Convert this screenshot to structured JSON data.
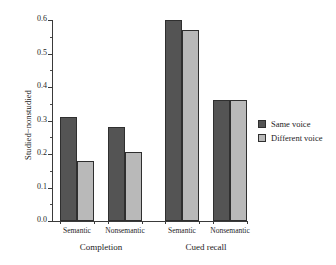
{
  "chart_data": {
    "type": "bar",
    "title": "",
    "subtitle": "",
    "xlabel": "",
    "ylabel": "Studied−nonstudied",
    "ylim": [
      0.0,
      0.6
    ],
    "grid": false,
    "legend_position": "right",
    "categories": [
      "Semantic",
      "Nonsemantic",
      "Semantic",
      "Nonsemantic"
    ],
    "group_labels": [
      "Completion",
      "Cued recall"
    ],
    "group_spans": [
      2,
      2
    ],
    "series": [
      {
        "name": "Same voice",
        "color": "#545454",
        "values": [
          0.31,
          0.28,
          0.6,
          0.36
        ]
      },
      {
        "name": "Different voice",
        "color": "#b9b9b9",
        "values": [
          0.18,
          0.205,
          0.57,
          0.36
        ]
      }
    ],
    "y_major_ticks": [
      {
        "value": 0.0,
        "label": "0.0"
      },
      {
        "value": 0.1,
        "label": "0.1"
      },
      {
        "value": 0.2,
        "label": "0.2"
      },
      {
        "value": 0.3,
        "label": "0.3"
      },
      {
        "value": 0.4,
        "label": "0.4"
      },
      {
        "value": 0.5,
        "label": "0.5"
      },
      {
        "value": 0.6,
        "label": "0.6"
      }
    ],
    "y_minor_ticks": [
      0.05,
      0.15,
      0.25,
      0.35,
      0.45,
      0.55
    ]
  },
  "legend": {
    "items": [
      {
        "label": "Same voice",
        "color": "#545454"
      },
      {
        "label": "Different voice",
        "color": "#b9b9b9"
      }
    ]
  },
  "axis": {
    "y_label": "Studied−nonstudied"
  }
}
